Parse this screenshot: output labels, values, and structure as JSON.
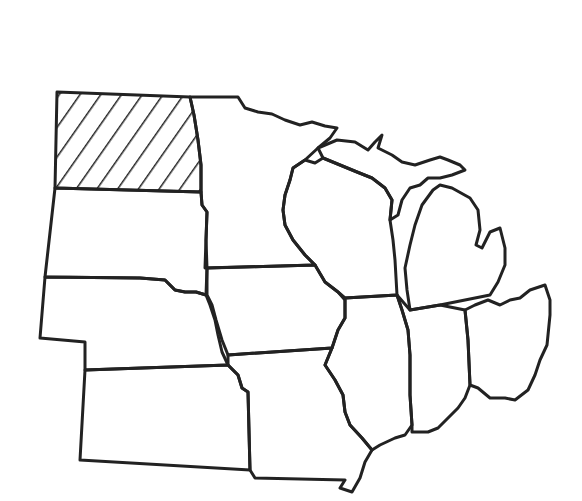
{
  "map": {
    "region": "US Midwest",
    "style": "black outline map, no labels",
    "highlighted_state": "North Dakota",
    "highlight_pattern": "diagonal-hatch",
    "stroke_color": "#222222",
    "background_color": "#ffffff",
    "states": [
      {
        "id": "north-dakota",
        "highlighted": true
      },
      {
        "id": "south-dakota",
        "highlighted": false
      },
      {
        "id": "nebraska",
        "highlighted": false
      },
      {
        "id": "kansas",
        "highlighted": false
      },
      {
        "id": "minnesota",
        "highlighted": false
      },
      {
        "id": "iowa",
        "highlighted": false
      },
      {
        "id": "missouri",
        "highlighted": false
      },
      {
        "id": "wisconsin",
        "highlighted": false
      },
      {
        "id": "illinois",
        "highlighted": false
      },
      {
        "id": "michigan",
        "highlighted": false
      },
      {
        "id": "indiana",
        "highlighted": false
      },
      {
        "id": "ohio",
        "highlighted": false
      }
    ]
  }
}
